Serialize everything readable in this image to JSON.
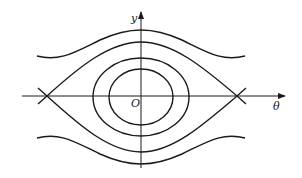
{
  "diagram": {
    "type": "phase-portrait",
    "axes": {
      "x_label": "θ",
      "y_label": "y",
      "origin_label": "O"
    },
    "colors": {
      "stroke": "#1a1a1a",
      "background": "#ffffff"
    }
  }
}
